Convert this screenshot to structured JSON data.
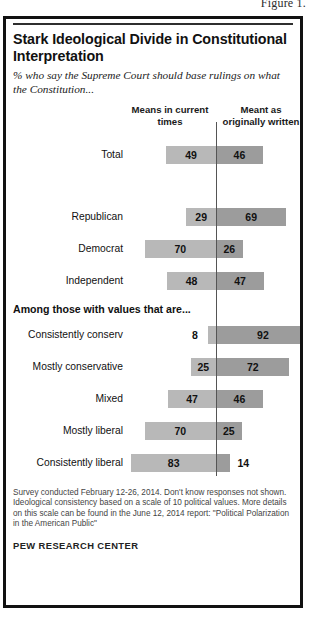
{
  "figure_caption": "Figure 1.",
  "title": "Stark Ideological Divide in Constitutional Interpretation",
  "subtitle": "% who say the Supreme Court should base rulings on what the Constitution...",
  "headers": {
    "left": "Means in current times",
    "right": "Meant as originally written"
  },
  "section_header": "Among those with values that are...",
  "footnote": "Survey conducted February 12-26, 2014. Don't know responses not shown. Ideological consistency based on a scale of 10 political values. More details on this scale can be found in the June 12, 2014 report: \"Political Polarization in the American Public\"",
  "brand": "PEW RESEARCH CENTER",
  "colors": {
    "left_bar": "#b8b8b8",
    "right_bar": "#9c9c9c",
    "axis": "#555555",
    "border": "#111111"
  },
  "chart_data": {
    "type": "bar",
    "subtype": "diverging-stacked",
    "title": "Stark Ideological Divide in Constitutional Interpretation",
    "subtitle": "% who say the Supreme Court should base rulings on what the Constitution...",
    "xlabel": "",
    "ylabel": "",
    "xlim": [
      0,
      100
    ],
    "grid": false,
    "legend_position": "top",
    "series": [
      {
        "name": "Means in current times",
        "color": "#b8b8b8",
        "values": [
          49,
          29,
          70,
          48,
          8,
          25,
          47,
          70,
          83
        ]
      },
      {
        "name": "Meant as originally written",
        "color": "#9c9c9c",
        "values": [
          46,
          69,
          26,
          47,
          92,
          72,
          46,
          25,
          14
        ]
      }
    ],
    "categories": [
      "Total",
      "Republican",
      "Democrat",
      "Independent",
      "Consistently conserv",
      "Mostly conservative",
      "Mixed",
      "Mostly liberal",
      "Consistently liberal"
    ],
    "groups": [
      {
        "label": "",
        "categories": [
          "Total"
        ]
      },
      {
        "label": "",
        "categories": [
          "Republican",
          "Democrat",
          "Independent"
        ]
      },
      {
        "label": "Among those with values that are...",
        "categories": [
          "Consistently conserv",
          "Mostly conservative",
          "Mixed",
          "Mostly liberal",
          "Consistently liberal"
        ]
      }
    ]
  },
  "rows": [
    {
      "label": "Total",
      "left": 49,
      "right": 46,
      "gap_before": 8,
      "left_outside": false,
      "right_outside": false
    },
    {
      "label": "Republican",
      "left": 29,
      "right": 69,
      "gap_before": 36,
      "left_outside": false,
      "right_outside": false
    },
    {
      "label": "Democrat",
      "left": 70,
      "right": 26,
      "gap_before": 6,
      "left_outside": false,
      "right_outside": false
    },
    {
      "label": "Independent",
      "left": 48,
      "right": 47,
      "gap_before": 6,
      "left_outside": false,
      "right_outside": false
    },
    {
      "label": "Consistently conserv",
      "left": 8,
      "right": 92,
      "gap_before": 8,
      "left_outside": true,
      "right_outside": false
    },
    {
      "label": "Mostly conservative",
      "left": 25,
      "right": 72,
      "gap_before": 6,
      "left_outside": false,
      "right_outside": false
    },
    {
      "label": "Mixed",
      "left": 47,
      "right": 46,
      "gap_before": 6,
      "left_outside": false,
      "right_outside": false
    },
    {
      "label": "Mostly liberal",
      "left": 70,
      "right": 25,
      "gap_before": 6,
      "left_outside": false,
      "right_outside": false
    },
    {
      "label": "Consistently liberal",
      "left": 83,
      "right": 14,
      "gap_before": 6,
      "left_outside": false,
      "right_outside": true
    }
  ]
}
